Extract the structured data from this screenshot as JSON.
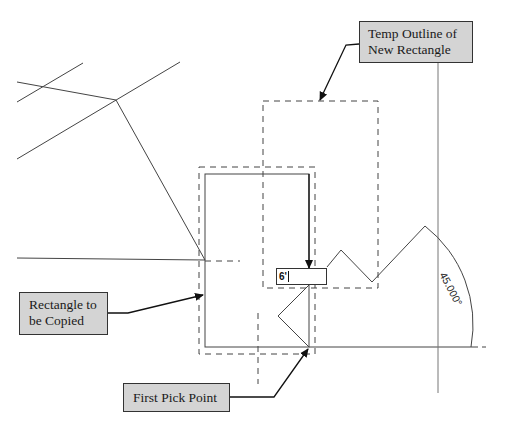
{
  "callouts": {
    "temp_outline": {
      "line1": "Temp Outline of",
      "line2": "New Rectangle"
    },
    "rectangle": {
      "line1": "Rectangle to",
      "line2": "be Copied"
    },
    "pick_point": {
      "label": "First Pick Point"
    }
  },
  "dimension_input": {
    "value": "6'"
  },
  "angle": {
    "label": "45.000°"
  },
  "colors": {
    "line": "#333333",
    "callout_fill": "#d4d4d4",
    "background": "#ffffff"
  }
}
